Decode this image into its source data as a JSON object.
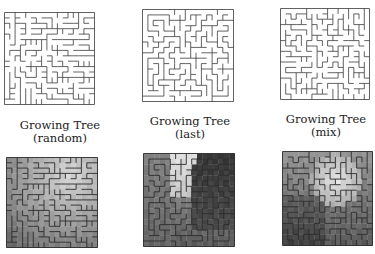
{
  "panels": [
    {
      "id": "random",
      "title": "Growing Tree",
      "subtitle": "(random)",
      "seed": 11,
      "maze": {
        "x": 4,
        "y": 12,
        "w": 91,
        "h": 93
      },
      "heat": {
        "x": 6,
        "y": 157,
        "w": 92,
        "h": 91,
        "style": "radial-light-top"
      }
    },
    {
      "id": "last",
      "title": "Growing Tree",
      "subtitle": "(last)",
      "seed": 23,
      "maze": {
        "x": 142,
        "y": 9,
        "w": 92,
        "h": 93
      },
      "heat": {
        "x": 143,
        "y": 153,
        "w": 92,
        "h": 94,
        "style": "regions"
      }
    },
    {
      "id": "mix",
      "title": "Growing Tree",
      "subtitle": "(mix)",
      "seed": 37,
      "maze": {
        "x": 280,
        "y": 8,
        "w": 90,
        "h": 92
      },
      "heat": {
        "x": 282,
        "y": 151,
        "w": 91,
        "h": 95,
        "style": "blob"
      }
    }
  ],
  "captions": [
    {
      "title": "Growing Tree",
      "subtitle": "(random)",
      "x": 0,
      "y": 119
    },
    {
      "title": "Growing Tree",
      "subtitle": "(last)",
      "x": 130,
      "y": 115
    },
    {
      "title": "Growing Tree",
      "subtitle": "(mix)",
      "x": 270,
      "y": 113
    }
  ],
  "grid": {
    "cols": 17,
    "rows": 17
  },
  "colors": {
    "wall": "#3a3a3a",
    "background": "#ffffff"
  }
}
